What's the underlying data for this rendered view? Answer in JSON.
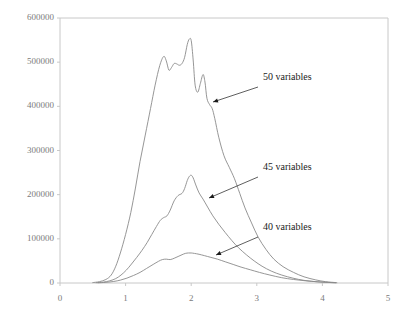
{
  "chart_data": {
    "type": "line",
    "title": "",
    "xlabel": "",
    "ylabel": "",
    "xlim": [
      0,
      5
    ],
    "ylim": [
      0,
      600000
    ],
    "grid": false,
    "legend_position": "inline-annotations",
    "x_ticks": [
      "0",
      "1",
      "2",
      "3",
      "4",
      "5"
    ],
    "x_tick_values": [
      0,
      1,
      2,
      3,
      4,
      5
    ],
    "y_ticks": [
      "0",
      "100000",
      "200000",
      "300000",
      "400000",
      "500000",
      "600000"
    ],
    "y_tick_values": [
      0,
      100000,
      200000,
      300000,
      400000,
      500000,
      600000
    ],
    "line_color": "#8a8a8a",
    "axis_color": "#c8c8c8",
    "annotation_color": "#1a1a1a",
    "series": [
      {
        "name": "50 variables",
        "label": "50 variables",
        "x": [
          0.5,
          0.6,
          0.7,
          0.78,
          0.85,
          0.92,
          1.0,
          1.08,
          1.15,
          1.22,
          1.3,
          1.38,
          1.45,
          1.52,
          1.58,
          1.62,
          1.66,
          1.7,
          1.74,
          1.78,
          1.82,
          1.86,
          1.9,
          1.94,
          1.97,
          2.0,
          2.03,
          2.06,
          2.1,
          2.14,
          2.18,
          2.21,
          2.24,
          2.28,
          2.32,
          2.36,
          2.42,
          2.5,
          2.58,
          2.66,
          2.74,
          2.82,
          2.92,
          3.02,
          3.14,
          3.26,
          3.4,
          3.56,
          3.72,
          3.9,
          4.05,
          4.2
        ],
        "y": [
          1000,
          3000,
          8000,
          18000,
          38000,
          68000,
          110000,
          160000,
          215000,
          275000,
          335000,
          395000,
          448000,
          492000,
          513000,
          503000,
          482000,
          488000,
          497000,
          496000,
          493000,
          497000,
          511000,
          540000,
          552000,
          549000,
          505000,
          448000,
          432000,
          452000,
          472000,
          455000,
          418000,
          404000,
          395000,
          372000,
          330000,
          288000,
          262000,
          236000,
          203000,
          170000,
          136000,
          104000,
          76000,
          54000,
          37000,
          24000,
          14000,
          7000,
          3000,
          1000
        ]
      },
      {
        "name": "45 variables",
        "label": "45 variables",
        "x": [
          0.55,
          0.66,
          0.76,
          0.85,
          0.93,
          1.01,
          1.09,
          1.17,
          1.25,
          1.33,
          1.4,
          1.47,
          1.53,
          1.58,
          1.63,
          1.68,
          1.74,
          1.8,
          1.86,
          1.9,
          1.94,
          1.97,
          2.0,
          2.03,
          2.07,
          2.12,
          2.18,
          2.25,
          2.33,
          2.42,
          2.52,
          2.62,
          2.72,
          2.84,
          2.96,
          3.08,
          3.22,
          3.38,
          3.55,
          3.72,
          3.9,
          4.05,
          4.2
        ],
        "y": [
          700,
          2000,
          5000,
          10000,
          18000,
          29000,
          43000,
          58000,
          74000,
          92000,
          110000,
          128000,
          142000,
          148000,
          152000,
          165000,
          186000,
          198000,
          203000,
          214000,
          232000,
          241000,
          244000,
          238000,
          222000,
          204000,
          190000,
          172000,
          152000,
          133000,
          114000,
          96000,
          80000,
          64000,
          50000,
          38000,
          27000,
          18000,
          11000,
          6000,
          3000,
          1500,
          600
        ]
      },
      {
        "name": "40 variables",
        "label": "40 variables",
        "x": [
          0.58,
          0.7,
          0.82,
          0.92,
          1.02,
          1.12,
          1.22,
          1.32,
          1.42,
          1.5,
          1.56,
          1.62,
          1.68,
          1.74,
          1.8,
          1.86,
          1.91,
          1.96,
          2.0,
          2.05,
          2.12,
          2.2,
          2.3,
          2.4,
          2.52,
          2.64,
          2.76,
          2.9,
          3.04,
          3.2,
          3.38,
          3.56,
          3.74,
          3.92,
          4.08,
          4.22
        ],
        "y": [
          500,
          1500,
          3500,
          6500,
          11000,
          17000,
          24000,
          33000,
          42000,
          49000,
          53000,
          54000,
          53000,
          56000,
          60000,
          64000,
          67000,
          68000,
          68000,
          67000,
          65000,
          62000,
          58000,
          54000,
          48000,
          42000,
          36000,
          30000,
          24000,
          18000,
          12000,
          8000,
          5000,
          2800,
          1400,
          600
        ]
      }
    ],
    "annotations": [
      {
        "text": "50 variables",
        "label_x": 263,
        "label_y": 78,
        "line_from": [
          258,
          87
        ],
        "line_to": [
          213,
          102
        ],
        "arrow_at": [
          213,
          102
        ]
      },
      {
        "text": "45 variables",
        "label_x": 263,
        "label_y": 168,
        "line_from": [
          258,
          177
        ],
        "line_to": [
          209,
          198
        ],
        "arrow_at": [
          209,
          198
        ]
      },
      {
        "text": "40 variables",
        "label_x": 263,
        "label_y": 228,
        "line_from": [
          258,
          237
        ],
        "line_to": [
          216,
          255
        ],
        "arrow_at": [
          216,
          255
        ]
      }
    ]
  },
  "axes": {
    "plot_left": 60,
    "plot_right": 388,
    "plot_top": 18,
    "plot_bottom": 283
  }
}
